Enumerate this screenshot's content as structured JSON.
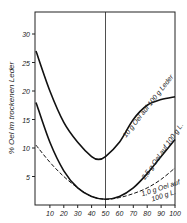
{
  "chart_data": {
    "type": "line",
    "title": "",
    "xlabel": "",
    "ylabel": "% Oel im trockenen Leder",
    "xlim": [
      0,
      100
    ],
    "ylim": [
      0,
      35
    ],
    "x_ticks": [
      "10",
      "20",
      "30",
      "40",
      "50",
      "60",
      "70",
      "80",
      "90",
      "100"
    ],
    "y_ticks": [
      "5",
      "10",
      "15",
      "20",
      "25",
      "30"
    ],
    "grid": false,
    "vertical_reference_line_x": 50,
    "series": [
      {
        "name": "10 g Oel auf 100 g Leder",
        "style": "solid",
        "x": [
          0,
          10,
          20,
          30,
          40,
          45,
          50,
          60,
          70,
          80,
          90,
          100
        ],
        "values": [
          27,
          20,
          14.5,
          11,
          8.5,
          8,
          8.5,
          11,
          15,
          17.5,
          18.5,
          19
        ]
      },
      {
        "name": "2,5 g Oel auf 100 g L.",
        "style": "solid",
        "x": [
          0,
          10,
          20,
          30,
          40,
          50,
          60,
          70,
          80,
          90,
          100
        ],
        "values": [
          18,
          11,
          6,
          3,
          1.5,
          1,
          1.5,
          3,
          5.5,
          8.5,
          11.5
        ]
      },
      {
        "name": "1,0 g Oel auf 100 g L.",
        "style": "dashed",
        "x": [
          0,
          10,
          20,
          30,
          40,
          50,
          60,
          70,
          80,
          90,
          100
        ],
        "values": [
          10.5,
          7.5,
          5,
          3,
          1.5,
          1,
          1.3,
          2,
          3,
          4.5,
          6.5
        ]
      }
    ],
    "annotations": [
      "10 g Oel auf 100 g Leder",
      "2,5 g Oel auf 100 g L.",
      "1,0 g Oel auf 100 g L."
    ]
  }
}
